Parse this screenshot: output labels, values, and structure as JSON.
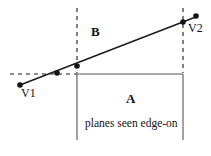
{
  "figure": {
    "background_color": "#ffffff",
    "stroke_color": "#1a1a1a",
    "width": 211,
    "height": 156
  },
  "labels": {
    "region_a": "A",
    "region_b": "B",
    "vertex_1": "V1",
    "vertex_2": "V2",
    "caption": "planes seen edge-on"
  },
  "geometry": {
    "left_plane_x": 77,
    "right_plane_x": 183,
    "plane_top_y": 8,
    "plane_bottom_y": 140,
    "horizon_y": 74,
    "horizon_dash_start_x": 10,
    "sight_line": {
      "x1": 20,
      "y1": 85,
      "x2": 197,
      "y2": 17
    },
    "points": [
      {
        "name": "v1-point",
        "x": 20,
        "y": 85
      },
      {
        "name": "horizon-intersection-point",
        "x": 57,
        "y": 73
      },
      {
        "name": "left-plane-intersection-point",
        "x": 77,
        "y": 66
      },
      {
        "name": "right-plane-intersection-point",
        "x": 183,
        "y": 22
      },
      {
        "name": "v2-point",
        "x": 196,
        "y": 16
      }
    ]
  }
}
